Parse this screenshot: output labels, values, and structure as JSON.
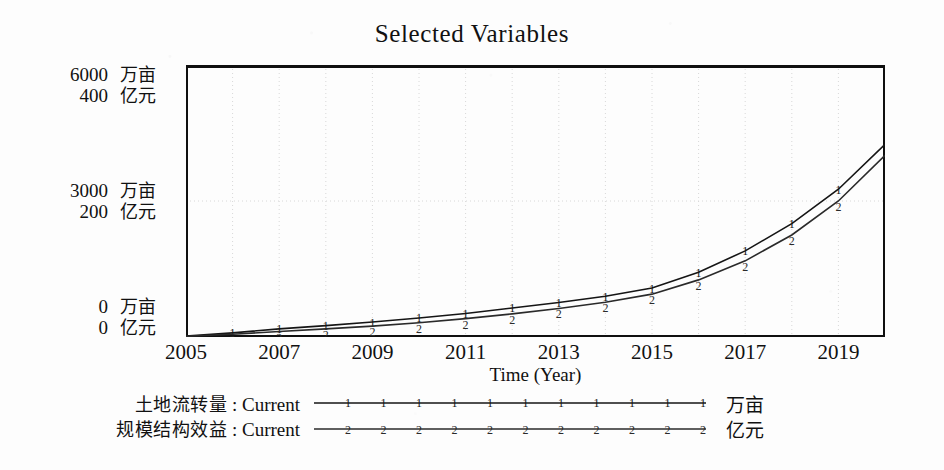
{
  "chart_data": {
    "type": "line",
    "title": "Selected Variables",
    "xlabel": "Time (Year)",
    "ylabel": "",
    "grid": true,
    "legend_position": "bottom",
    "x": [
      2005,
      2006,
      2007,
      2008,
      2009,
      2010,
      2011,
      2012,
      2013,
      2014,
      2015,
      2016,
      2017,
      2018,
      2019,
      2020
    ],
    "xlim": [
      2005,
      2020
    ],
    "xticks": [
      "2005",
      "2007",
      "2009",
      "2011",
      "2013",
      "2015",
      "2017",
      "2019"
    ],
    "xtick_values": [
      2005,
      2007,
      2009,
      2011,
      2013,
      2015,
      2017,
      2019
    ],
    "axes": [
      {
        "id": "left-primary",
        "unit": "万亩",
        "ylim": [
          0,
          6000
        ],
        "yticks": [
          "0",
          "3000",
          "6000"
        ],
        "ytick_values": [
          0,
          3000,
          6000
        ]
      },
      {
        "id": "left-secondary",
        "unit": "亿元",
        "ylim": [
          0,
          400
        ],
        "yticks": [
          "0",
          "200",
          "400"
        ],
        "ytick_values": [
          0,
          200,
          400
        ]
      }
    ],
    "series": [
      {
        "name": "土地流转量 : Current",
        "marker": "1",
        "unit": "万亩",
        "axis": "left-primary",
        "color": "#151515",
        "values": [
          20,
          90,
          180,
          250,
          330,
          420,
          520,
          640,
          760,
          900,
          1080,
          1430,
          1900,
          2500,
          3260,
          4250
        ]
      },
      {
        "name": "规模结构效益 : Current",
        "marker": "2",
        "unit": "亿元",
        "axis": "left-secondary",
        "color": "#2a2a2a",
        "values": [
          1,
          4,
          8,
          12,
          16,
          21,
          27,
          34,
          42,
          51,
          63,
          84,
          112,
          150,
          200,
          267
        ]
      }
    ]
  },
  "yaxis_labels": {
    "top": {
      "primary_value": "6000",
      "primary_unit": "万亩",
      "secondary_value": "400",
      "secondary_unit": "亿元"
    },
    "middle": {
      "primary_value": "3000",
      "primary_unit": "万亩",
      "secondary_value": "200",
      "secondary_unit": "亿元"
    },
    "bottom": {
      "primary_value": "0",
      "primary_unit": "万亩",
      "secondary_value": "0",
      "secondary_unit": "亿元"
    }
  },
  "legend": {
    "rows": [
      {
        "name_cn": "土地流转量",
        "separator": " : ",
        "name_en": "Current",
        "marker": "1",
        "unit": "万亩"
      },
      {
        "name_cn": "规模结构效益",
        "separator": " : ",
        "name_en": "Current",
        "marker": "2",
        "unit": "亿元"
      }
    ]
  },
  "colors": {
    "frame": "#101010",
    "grid": "#d8d8d8",
    "background": "#fdfdfd",
    "series1": "#151515",
    "series2": "#2a2a2a"
  }
}
